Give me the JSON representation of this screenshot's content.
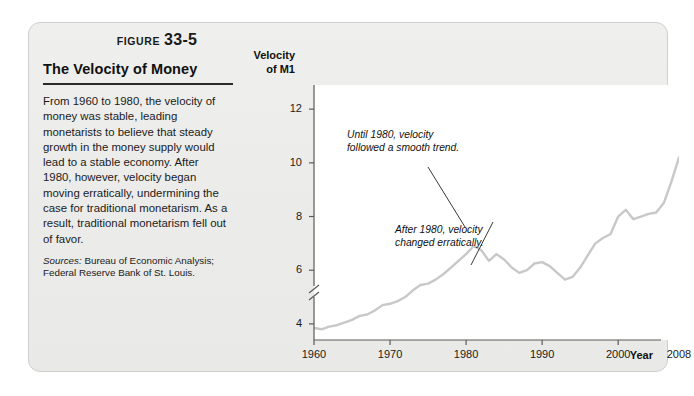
{
  "figure": {
    "label_word": "FIGURE",
    "label_number": "33-5",
    "title": "The Velocity of Money",
    "body": "From 1960 to 1980, the velocity of money was stable, leading monetarists to believe that steady growth in the money supply would lead to a stable economy. After 1980, however, velocity began moving erratically, undermining the case for traditional monetarism. As a result, traditional monetarism fell out of favor.",
    "sources_label": "Sources:",
    "sources_text": " Bureau of Economic Analysis; Federal Reserve Bank of St. Louis."
  },
  "colors": {
    "panel_background": "#ececea",
    "panel_border": "#cfcfcd",
    "plot_background": "#ffffff",
    "line": "#c8c8c8",
    "axis": "#5a5a5a",
    "text": "#111111",
    "leader_line": "#3a3a3a"
  },
  "chart_data": {
    "type": "line",
    "title": "The Velocity of Money",
    "xlabel": "Year",
    "ylabel": "Velocity of M1",
    "ylabel_line1": "Velocity",
    "ylabel_line2": "of M1",
    "xlim": [
      1960,
      2008
    ],
    "ylim": [
      3.4,
      12.9
    ],
    "yticks": [
      4,
      6,
      8,
      10,
      12
    ],
    "ytick_labels": [
      "4",
      "6",
      "8",
      "10",
      "12"
    ],
    "xticks": [
      1960,
      1970,
      1980,
      1990,
      2000,
      2008
    ],
    "xtick_labels": [
      "1960",
      "1970",
      "1980",
      "1990",
      "2000",
      "2008"
    ],
    "grid": false,
    "legend": false,
    "axis_break_y": true,
    "series": [
      {
        "name": "Velocity of M1",
        "x": [
          1960,
          1961,
          1962,
          1963,
          1964,
          1965,
          1966,
          1967,
          1968,
          1969,
          1970,
          1971,
          1972,
          1973,
          1974,
          1975,
          1976,
          1977,
          1978,
          1979,
          1980,
          1981,
          1982,
          1983,
          1984,
          1985,
          1986,
          1987,
          1988,
          1989,
          1990,
          1991,
          1992,
          1993,
          1994,
          1995,
          1996,
          1997,
          1998,
          1999,
          2000,
          2001,
          2002,
          2003,
          2004,
          2005,
          2006,
          2007,
          2008
        ],
        "values": [
          3.85,
          3.8,
          3.9,
          3.95,
          4.05,
          4.15,
          4.3,
          4.35,
          4.5,
          4.7,
          4.75,
          4.85,
          5.0,
          5.25,
          5.45,
          5.5,
          5.65,
          5.85,
          6.1,
          6.35,
          6.6,
          6.9,
          6.75,
          6.35,
          6.6,
          6.4,
          6.1,
          5.9,
          6.0,
          6.25,
          6.3,
          6.15,
          5.9,
          5.65,
          5.75,
          6.1,
          6.55,
          7.0,
          7.2,
          7.35,
          8.0,
          8.25,
          7.9,
          8.0,
          8.1,
          8.15,
          8.5,
          9.3,
          10.2
        ]
      }
    ],
    "annotations": [
      {
        "id": "annotation-1",
        "line1": "Until 1980, velocity",
        "line2": "followed a smooth trend."
      },
      {
        "id": "annotation-2",
        "line1": "After 1980, velocity",
        "line2": "changed erratically."
      }
    ]
  }
}
